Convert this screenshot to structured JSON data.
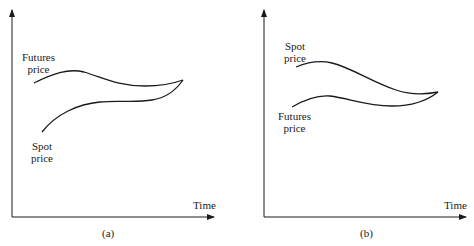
{
  "panels": [
    {
      "caption": "(a)",
      "x_axis_label": "Time",
      "upper_curve": {
        "label_line1": "Futures",
        "label_line2": "price"
      },
      "lower_curve": {
        "label_line1": "Spot",
        "label_line2": "price"
      }
    },
    {
      "caption": "(b)",
      "x_axis_label": "Time",
      "upper_curve": {
        "label_line1": "Spot",
        "label_line2": "price"
      },
      "lower_curve": {
        "label_line1": "Futures",
        "label_line2": "price"
      }
    }
  ],
  "colors": {
    "line": "#1a1a1a",
    "background": "#ffffff"
  }
}
